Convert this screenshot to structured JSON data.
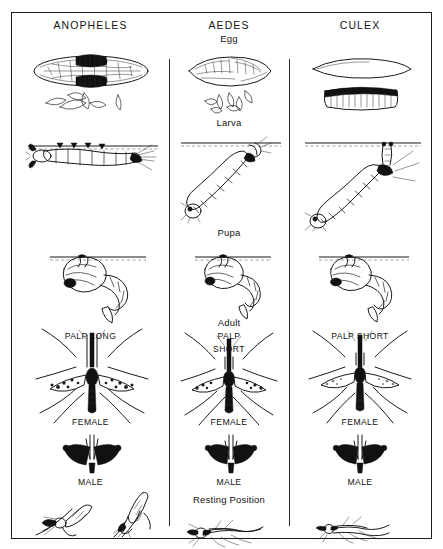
{
  "chart": {
    "type": "comparison-diagram",
    "columns": [
      {
        "id": "anopheles",
        "header": "ANOPHELES"
      },
      {
        "id": "aedes",
        "header": "AEDES"
      },
      {
        "id": "culex",
        "header": "CULEX"
      }
    ],
    "stage_labels": [
      {
        "id": "egg",
        "text": "Egg"
      },
      {
        "id": "larva",
        "text": "Larva"
      },
      {
        "id": "pupa",
        "text": "Pupa"
      },
      {
        "id": "adult",
        "text": "Adult"
      },
      {
        "id": "resting-position",
        "text": "Resting Position"
      }
    ],
    "cell_labels": {
      "anopheles": {
        "palp": "PALP LONG",
        "female": "FEMALE",
        "male": "MALE"
      },
      "aedes": {
        "palp_line1": "PALP",
        "palp_line2": "SHORT",
        "female": "FEMALE",
        "male": "MALE"
      },
      "culex": {
        "palp": "PALP SHORT",
        "female": "FEMALE",
        "male": "MALE"
      }
    },
    "colors": {
      "ink": "#1b1b1b",
      "border": "#1a1a1a",
      "divider": "#2b2b2b",
      "background": "#ffffff"
    }
  }
}
